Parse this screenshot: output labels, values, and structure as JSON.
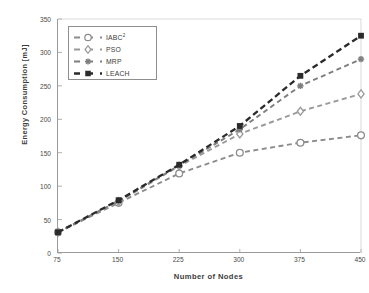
{
  "chart_data": {
    "type": "line",
    "title": "",
    "xlabel": "Number of Nodes",
    "ylabel": "Energy Consumption [mJ]",
    "x": [
      75,
      150,
      225,
      300,
      375,
      450
    ],
    "xtick_labels": [
      "75",
      "150",
      "225",
      "300",
      "375",
      "450"
    ],
    "ytick_labels": [
      "0",
      "50",
      "100",
      "150",
      "200",
      "250",
      "300",
      "350"
    ],
    "yticks": [
      0,
      50,
      100,
      150,
      200,
      250,
      300,
      350
    ],
    "xlim": [
      75,
      450
    ],
    "ylim": [
      0,
      350
    ],
    "grid": false,
    "legend_position": "upper left",
    "series": [
      {
        "name": "IABC2",
        "label": "IABC",
        "label_sup": "2",
        "marker": "circle-open",
        "color": "#8c8c8c",
        "linestyle": "dashed",
        "values": [
          31,
          75,
          119,
          150,
          165,
          176
        ]
      },
      {
        "name": "PSO",
        "label": "PSO",
        "label_sup": "",
        "marker": "diamond-open",
        "color": "#9a9a9a",
        "linestyle": "dashed",
        "values": [
          31,
          77,
          130,
          178,
          212,
          238
        ]
      },
      {
        "name": "MRP",
        "label": "MRP",
        "label_sup": "",
        "marker": "star-small",
        "color": "#7e7e7e",
        "linestyle": "dashed",
        "values": [
          31,
          78,
          131,
          185,
          250,
          290
        ]
      },
      {
        "name": "LEACH",
        "label": "LEACH",
        "label_sup": "",
        "marker": "square-filled",
        "color": "#2b2b2b",
        "linestyle": "dashed",
        "values": [
          31,
          79,
          132,
          190,
          265,
          325
        ]
      }
    ]
  }
}
